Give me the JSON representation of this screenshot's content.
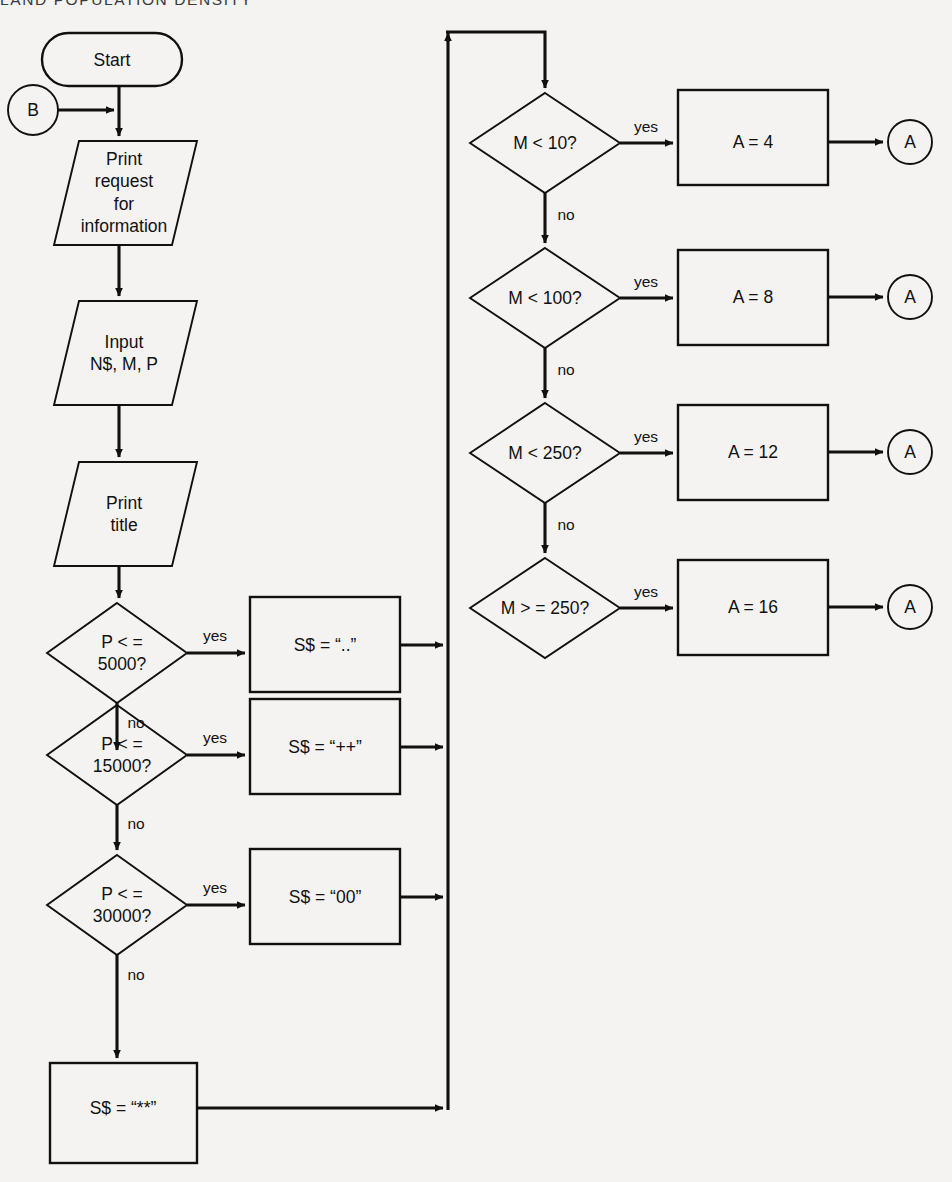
{
  "page": {
    "header_text": "LAND POPULATION DENSITY",
    "background_color": "#f4f3f1",
    "line_color": "#101010"
  },
  "diagram": {
    "type": "flowchart",
    "title": "LAND POPULATION DENSITY",
    "nodes": [
      {
        "id": "start",
        "shape": "terminator",
        "text": "Start"
      },
      {
        "id": "connB",
        "shape": "connector",
        "text": "B"
      },
      {
        "id": "printreq",
        "shape": "io",
        "text": "Print\nrequest\nfor\ninformation"
      },
      {
        "id": "input",
        "shape": "io",
        "text": "Input\nN$, M, P"
      },
      {
        "id": "printtitle",
        "shape": "io",
        "text": "Print\ntitle"
      },
      {
        "id": "dec5000",
        "shape": "decision",
        "text": "P < =\n5000?"
      },
      {
        "id": "dec15000",
        "shape": "decision",
        "text": "P < =\n15000?"
      },
      {
        "id": "dec30000",
        "shape": "decision",
        "text": "P < =\n30000?"
      },
      {
        "id": "ss_dots",
        "shape": "process",
        "text": "S$ = “..”"
      },
      {
        "id": "ss_plus",
        "shape": "process",
        "text": "S$ = “++”"
      },
      {
        "id": "ss_zero",
        "shape": "process",
        "text": "S$ = “00”"
      },
      {
        "id": "ss_star",
        "shape": "process",
        "text": "S$ = “**”"
      },
      {
        "id": "decM10",
        "shape": "decision",
        "text": "M < 10?"
      },
      {
        "id": "decM100",
        "shape": "decision",
        "text": "M < 100?"
      },
      {
        "id": "decM250",
        "shape": "decision",
        "text": "M < 250?"
      },
      {
        "id": "decMge250",
        "shape": "decision",
        "text": "M > = 250?"
      },
      {
        "id": "a4",
        "shape": "process",
        "text": "A = 4"
      },
      {
        "id": "a8",
        "shape": "process",
        "text": "A = 8"
      },
      {
        "id": "a12",
        "shape": "process",
        "text": "A = 12"
      },
      {
        "id": "a16",
        "shape": "process",
        "text": "A = 16"
      },
      {
        "id": "connA1",
        "shape": "connector",
        "text": "A"
      },
      {
        "id": "connA2",
        "shape": "connector",
        "text": "A"
      },
      {
        "id": "connA3",
        "shape": "connector",
        "text": "A"
      },
      {
        "id": "connA4",
        "shape": "connector",
        "text": "A"
      }
    ],
    "edge_labels": {
      "yes": "yes",
      "no": "no"
    },
    "edges": [
      {
        "from": "start",
        "to": "printreq",
        "label": ""
      },
      {
        "from": "connB",
        "to": "printreq",
        "label": ""
      },
      {
        "from": "printreq",
        "to": "input",
        "label": ""
      },
      {
        "from": "input",
        "to": "printtitle",
        "label": ""
      },
      {
        "from": "printtitle",
        "to": "dec5000",
        "label": ""
      },
      {
        "from": "dec5000",
        "to": "ss_dots",
        "label": "yes"
      },
      {
        "from": "dec5000",
        "to": "dec15000",
        "label": "no"
      },
      {
        "from": "dec15000",
        "to": "ss_plus",
        "label": "yes"
      },
      {
        "from": "dec15000",
        "to": "dec30000",
        "label": "no"
      },
      {
        "from": "dec30000",
        "to": "ss_zero",
        "label": "yes"
      },
      {
        "from": "dec30000",
        "to": "ss_star",
        "label": "no"
      },
      {
        "from": "ss_dots",
        "to": "collector",
        "label": ""
      },
      {
        "from": "ss_plus",
        "to": "collector",
        "label": ""
      },
      {
        "from": "ss_zero",
        "to": "collector",
        "label": ""
      },
      {
        "from": "ss_star",
        "to": "collector",
        "label": ""
      },
      {
        "from": "collector",
        "to": "decM10",
        "label": ""
      },
      {
        "from": "decM10",
        "to": "a4",
        "label": "yes"
      },
      {
        "from": "decM10",
        "to": "decM100",
        "label": "no"
      },
      {
        "from": "decM100",
        "to": "a8",
        "label": "yes"
      },
      {
        "from": "decM100",
        "to": "decM250",
        "label": "no"
      },
      {
        "from": "decM250",
        "to": "a12",
        "label": "yes"
      },
      {
        "from": "decM250",
        "to": "decMge250",
        "label": "no"
      },
      {
        "from": "decMge250",
        "to": "a16",
        "label": "yes"
      },
      {
        "from": "a4",
        "to": "connA1",
        "label": ""
      },
      {
        "from": "a8",
        "to": "connA2",
        "label": ""
      },
      {
        "from": "a12",
        "to": "connA3",
        "label": ""
      },
      {
        "from": "a16",
        "to": "connA4",
        "label": ""
      }
    ],
    "labels": {
      "start": "Start",
      "conn_b": "B",
      "print_request": "Print\nrequest\nfor\ninformation",
      "input_vars": "Input\nN$, M, P",
      "print_title": "Print\ntitle",
      "dec_5000": "P < =\n5000?",
      "dec_15000": "P < =\n15000?",
      "dec_30000": "P < =\n30000?",
      "ss_dots": "S$ = “..”",
      "ss_plus": "S$ = “++”",
      "ss_zero": "S$ = “00”",
      "ss_star": "S$ = “**”",
      "dec_m10": "M < 10?",
      "dec_m100": "M < 100?",
      "dec_m250": "M < 250?",
      "dec_mge250": "M > = 250?",
      "a4": "A = 4",
      "a8": "A = 8",
      "a12": "A = 12",
      "a16": "A = 16",
      "conn_a1": "A",
      "conn_a2": "A",
      "conn_a3": "A",
      "conn_a4": "A",
      "yes1": "yes",
      "yes2": "yes",
      "yes3": "yes",
      "yes4": "yes",
      "yes5": "yes",
      "yes6": "yes",
      "yes7": "yes",
      "no1": "no",
      "no2": "no",
      "no3": "no",
      "no4": "no",
      "no5": "no",
      "no6": "no"
    }
  }
}
